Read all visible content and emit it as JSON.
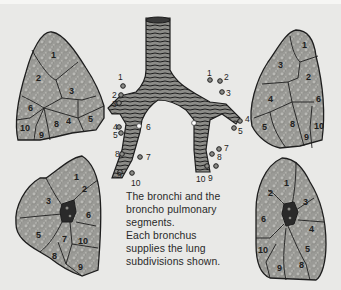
{
  "caption": {
    "lines": [
      "The bronchi and the",
      "broncho pulmonary",
      "segments.",
      "Each bronchus",
      "supplies the lung",
      "subdivisions shown."
    ]
  },
  "colors": {
    "background": "#e9e9e7",
    "lung_fill": "#9a9a96",
    "outline": "#1e1e1e",
    "bronchus_fill": "#8c8c88",
    "hilum": "#2a2a2a"
  },
  "bronchial_tree": {
    "right_labels": [
      "1",
      "2",
      "3",
      "4",
      "5",
      "6",
      "7",
      "8",
      "9",
      "10"
    ],
    "left_labels": [
      "1",
      "2",
      "3",
      "4",
      "5",
      "7",
      "8",
      "9",
      "10"
    ]
  },
  "lungs": {
    "top_left": {
      "view": "right lung lateral",
      "segments": [
        "1",
        "2",
        "3",
        "4",
        "5",
        "6",
        "8",
        "9",
        "10"
      ]
    },
    "top_right": {
      "view": "left lung lateral",
      "segments": [
        "1",
        "2",
        "3",
        "4",
        "5",
        "6",
        "8",
        "9",
        "10"
      ]
    },
    "bottom_left": {
      "view": "right lung medial",
      "segments": [
        "1",
        "2",
        "3",
        "5",
        "6",
        "7",
        "8",
        "9",
        "10"
      ]
    },
    "bottom_right": {
      "view": "left lung medial",
      "segments": [
        "1",
        "2",
        "3",
        "4",
        "5",
        "6",
        "8",
        "9",
        "10"
      ]
    }
  }
}
